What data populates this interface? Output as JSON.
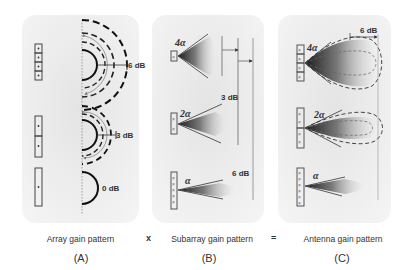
{
  "panels": [
    {
      "id": "A",
      "caption": "Array gain pattern",
      "letter": "(A)",
      "rows": [
        {
          "elements": 4,
          "gain_label": "6 dB"
        },
        {
          "elements": 2,
          "gain_label": "3 dB"
        },
        {
          "elements": 1,
          "gain_label": "0 dB"
        }
      ]
    },
    {
      "id": "B",
      "caption": "Subarray gain pattern",
      "letter": "(B)",
      "rows": [
        {
          "beamwidth": "4α",
          "gain_label": ""
        },
        {
          "beamwidth": "2α",
          "gain_label": "3 dB"
        },
        {
          "beamwidth": "α",
          "gain_label": "6 dB"
        }
      ]
    },
    {
      "id": "C",
      "caption": "Antenna gain pattern",
      "letter": "(C)",
      "rows": [
        {
          "beamwidth": "4α",
          "gain_label": "6 dB"
        },
        {
          "beamwidth": "2α",
          "gain_label": ""
        },
        {
          "beamwidth": "α",
          "gain_label": ""
        }
      ]
    }
  ],
  "operators": {
    "multiply": "x",
    "equals": "="
  },
  "colors": {
    "panel_bg": "#ececec",
    "beam_dark": "#2a2a2a",
    "stroke": "#222222"
  }
}
